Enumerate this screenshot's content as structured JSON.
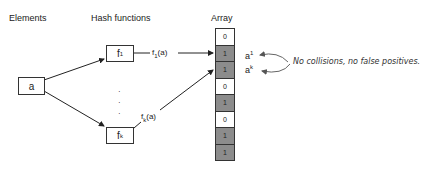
{
  "headers": {
    "elements": "Elements",
    "hash_functions": "Hash functions",
    "array": "Array"
  },
  "element": {
    "label": "a"
  },
  "hash_boxes": [
    {
      "name": "f",
      "sub": "1",
      "output_label": "f",
      "output_sub": "1",
      "output_arg": "(a)"
    },
    {
      "name": "f",
      "sub": "k",
      "output_label": "f",
      "output_sub": "k",
      "output_arg": "(a)"
    }
  ],
  "ellipsis": "·\n·\n·",
  "array": {
    "cells": [
      "0",
      "1",
      "1",
      "0",
      "1",
      "0",
      "1",
      "1"
    ],
    "set_color": "#8c8c8c",
    "unset_color": "#ffffff"
  },
  "annotations": {
    "a1": {
      "base": "a",
      "sup": "1"
    },
    "ak": {
      "base": "a",
      "sup": "k"
    },
    "note": "No collisions, no false positives."
  }
}
